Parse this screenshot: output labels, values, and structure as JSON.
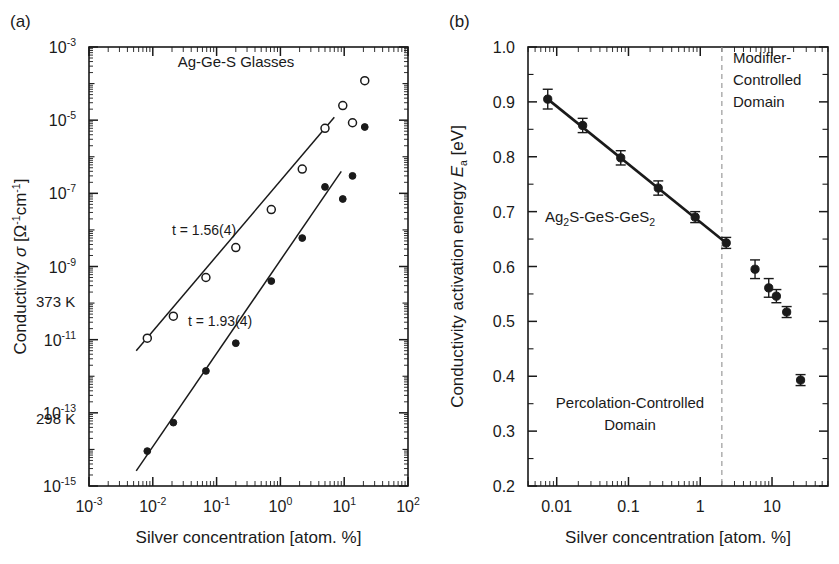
{
  "figure": {
    "background": "#ffffff",
    "ink": "#1a1a1a",
    "dashed_color": "#9a9a9a"
  },
  "panels": [
    {
      "key": "a",
      "label": "(a)",
      "title_annotation": "Ag-Ge-S Glasses",
      "xlabel": "Silver concentration [atom. %]",
      "ylabel_parts": {
        "prefix": "Conductivity ",
        "symbol": "σ",
        "units": " [Ω⁻¹cm⁻¹]"
      },
      "ylabel_plain": "Conductivity σ [Ω-1cm-1]",
      "xticks": [
        "10-3",
        "10-2",
        "10-1",
        "100",
        "101",
        "102"
      ],
      "xtick_base": "10",
      "xtick_exps": [
        "-3",
        "-2",
        "-1",
        "0",
        "1",
        "2"
      ],
      "ytick_base": "10",
      "ytick_exps": [
        "-3",
        "-5",
        "-7",
        "-9",
        "-11",
        "-13",
        "-15"
      ],
      "xlim_log": [
        -3,
        2
      ],
      "ylim_log": [
        -15,
        -3
      ],
      "series_labels": {
        "upper": "373 K",
        "lower": "298 K"
      },
      "fit_labels": {
        "upper": "t = 1.56(4)",
        "lower": "t = 1.93(4)"
      }
    },
    {
      "key": "b",
      "label": "(b)",
      "xlabel": "Silver concentration [atom. %]",
      "ylabel_parts": {
        "prefix": "Conductivity activation energy ",
        "symbol": "E",
        "subscript": "a",
        "units": " [eV]"
      },
      "ylabel_plain": "Conductivity activation energy Ea [eV]",
      "xticks": [
        "0.01",
        "0.1",
        "1",
        "10"
      ],
      "yticks": [
        "1.0",
        "0.9",
        "0.8",
        "0.7",
        "0.6",
        "0.5",
        "0.4",
        "0.3",
        "0.2"
      ],
      "xlim_log": [
        -2.4,
        1.78
      ],
      "ylim": [
        0.2,
        1.0
      ],
      "composition_annotation": {
        "prefix": "Ag",
        "sub1": "2",
        "mid": "S-GeS-GeS",
        "sub2": "2"
      },
      "composition_plain": "Ag2S-GeS-GeS2",
      "domain_right": [
        "Modifier-",
        "Controlled",
        "Domain"
      ],
      "domain_left": [
        "Percolation-Controlled",
        "Domain"
      ],
      "divider_value": 2.0
    }
  ],
  "chart_data": [
    {
      "type": "scatter",
      "panel": "a",
      "title": "Ag-Ge-S Glasses",
      "xlabel": "Silver concentration [atom. %]",
      "ylabel": "Conductivity σ [Ω-1cm-1]",
      "xscale": "log",
      "yscale": "log",
      "xlim": [
        0.001,
        100
      ],
      "ylim": [
        1e-15,
        0.001
      ],
      "grid": false,
      "legend": "inline-text",
      "series": [
        {
          "name": "373 K",
          "marker": "open-circle",
          "x": [
            0.0082,
            0.021,
            0.068,
            0.2,
            0.72,
            2.2,
            5.0,
            9.5,
            13.5,
            21.0
          ],
          "y": [
            1.1e-11,
            4.4e-11,
            5e-10,
            3.3e-09,
            3.6e-08,
            4.6e-07,
            6e-06,
            2.5e-05,
            8.5e-06,
            0.00012
          ],
          "fit": {
            "label": "t = 1.56(4)",
            "slope_t": 1.56,
            "slope_err": 4,
            "x_start": 0.0055,
            "x_end": 7.0,
            "y_start": 5e-12,
            "y_end": 1.2e-05
          }
        },
        {
          "name": "298 K",
          "marker": "filled-circle",
          "x": [
            0.0082,
            0.021,
            0.068,
            0.2,
            0.72,
            2.2,
            5.0,
            9.5,
            13.5,
            21.0
          ],
          "y": [
            9e-15,
            5.4e-14,
            1.4e-12,
            8e-12,
            4e-10,
            6e-09,
            1.5e-07,
            7e-08,
            3e-07,
            6.5e-06
          ],
          "fit": {
            "label": "t = 1.93(4)",
            "slope_t": 1.93,
            "slope_err": 4,
            "x_start": 0.0055,
            "x_end": 9.0,
            "y_start": 2.6e-15,
            "y_end": 4e-07
          }
        }
      ]
    },
    {
      "type": "scatter",
      "panel": "b",
      "xlabel": "Silver concentration [atom. %]",
      "ylabel": "Conductivity activation energy Ea [eV]",
      "xscale": "log",
      "yscale": "linear",
      "xlim": [
        0.004,
        60
      ],
      "ylim": [
        0.2,
        1.0
      ],
      "grid": false,
      "annotations": [
        "Ag2S-GeS-GeS2",
        "Modifier-Controlled Domain",
        "Percolation-Controlled Domain"
      ],
      "divider": {
        "type": "vline",
        "x": 2.0,
        "style": "dashed"
      },
      "series": [
        {
          "name": "Ea",
          "marker": "filled-circle",
          "x": [
            0.0075,
            0.023,
            0.078,
            0.26,
            0.85,
            2.3,
            5.8,
            9.0,
            11.5,
            16.0,
            25.0
          ],
          "y": [
            0.905,
            0.857,
            0.798,
            0.743,
            0.69,
            0.643,
            0.595,
            0.561,
            0.546,
            0.517,
            0.393
          ],
          "yerr": [
            0.018,
            0.013,
            0.013,
            0.013,
            0.01,
            0.01,
            0.017,
            0.017,
            0.012,
            0.01,
            0.01
          ],
          "fit": {
            "type": "line",
            "x_start": 0.0075,
            "x_end": 2.3,
            "y_start": 0.905,
            "y_end": 0.643
          }
        }
      ]
    }
  ]
}
